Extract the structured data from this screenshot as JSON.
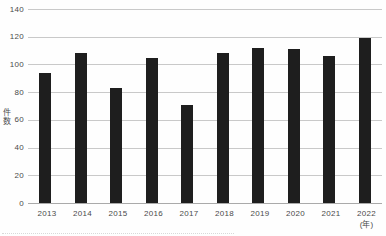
{
  "chart_data": {
    "type": "bar",
    "title": "",
    "categories": [
      "2013",
      "2014",
      "2015",
      "2016",
      "2017",
      "2018",
      "2019",
      "2020",
      "2021",
      "2022"
    ],
    "values": [
      94,
      108,
      83,
      105,
      71,
      108,
      112,
      111,
      106,
      119
    ],
    "xlabel": "(年)",
    "ylabel": "件数",
    "ylim": [
      0,
      140
    ],
    "yticks": [
      0,
      20,
      40,
      60,
      80,
      100,
      120,
      140
    ],
    "grid": true,
    "legend": "none",
    "colors": {
      "bar": "#1e1e1e",
      "gridline": "#c9c9c9",
      "axis_line": "#aaaaaa",
      "text": "#4a4a4a",
      "background": "#fefefe"
    }
  }
}
